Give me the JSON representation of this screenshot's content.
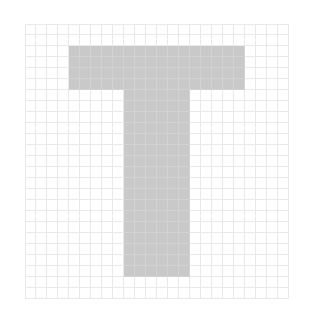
{
  "figure": {
    "kind": "pixel-grid-glyph",
    "glyph": "T",
    "background_color": "#ffffff",
    "grid_line_color": "#e9e9e9",
    "fill_color": "#c9c9c9",
    "fill_grid_line_color": "#d2d2d2",
    "grid": {
      "columns": 24,
      "rows": 25,
      "cell_size_px": 11,
      "origin_x_px": 25,
      "origin_y_px": 24
    },
    "shape": {
      "top_bar": {
        "col_start": 4,
        "col_end": 20,
        "row_start": 2,
        "row_end": 6
      },
      "stem": {
        "col_start": 9,
        "col_end": 15,
        "row_start": 6,
        "row_end": 23
      }
    },
    "filled_rows": [
      "000000000000000000000000",
      "000000000000000000000000",
      "000011111111111111110000",
      "000011111111111111110000",
      "000011111111111111110000",
      "000011111111111111110000",
      "000000000111111000000000",
      "000000000111111000000000",
      "000000000111111000000000",
      "000000000111111000000000",
      "000000000111111000000000",
      "000000000111111000000000",
      "000000000111111000000000",
      "000000000111111000000000",
      "000000000111111000000000",
      "000000000111111000000000",
      "000000000111111000000000",
      "000000000111111000000000",
      "000000000111111000000000",
      "000000000111111000000000",
      "000000000111111000000000",
      "000000000111111000000000",
      "000000000111111000000000",
      "000000000000000000000000",
      "000000000000000000000000"
    ]
  }
}
